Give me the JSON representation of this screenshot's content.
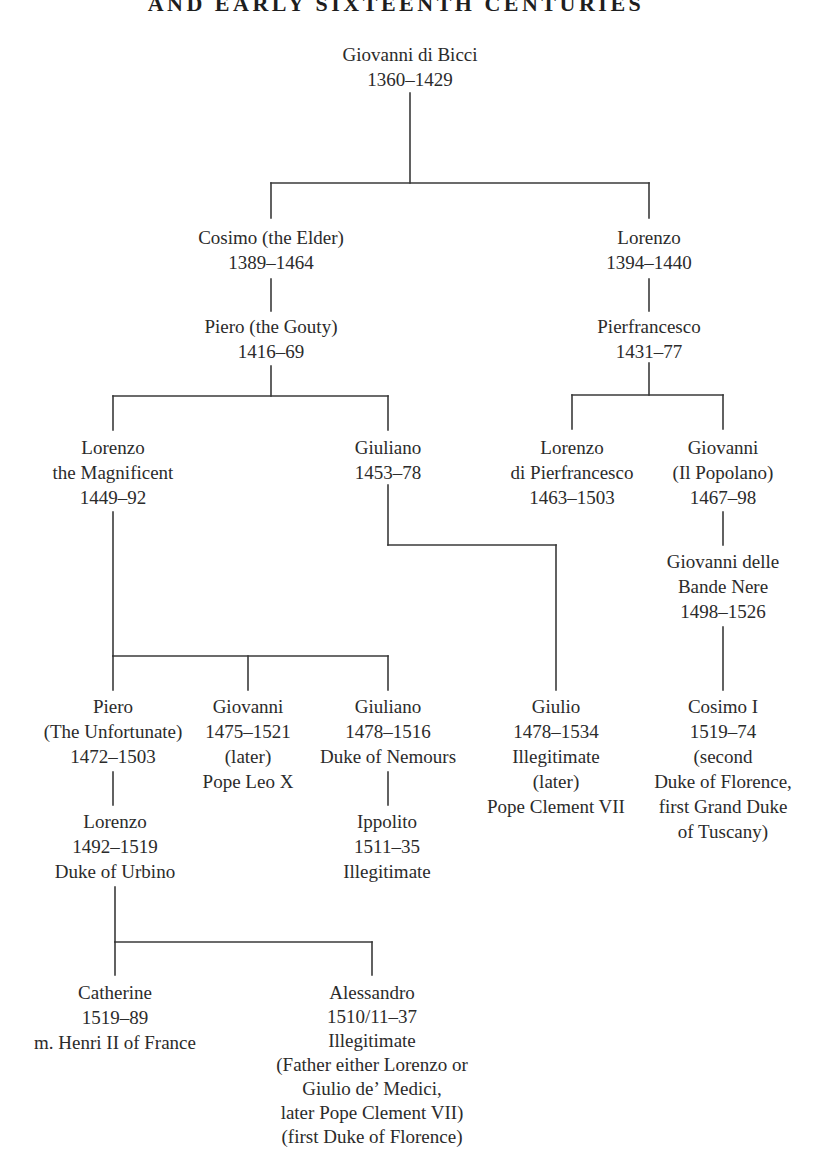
{
  "document": {
    "title_partial": "AND EARLY SIXTEENTH CENTURIES"
  },
  "tree": {
    "nodes": [
      {
        "id": "giovanni-di-bicci",
        "lines": [
          "Giovanni di Bicci",
          "1360–1429"
        ]
      },
      {
        "id": "cosimo-the-elder",
        "lines": [
          "Cosimo (the Elder)",
          "1389–1464"
        ]
      },
      {
        "id": "lorenzo-1394",
        "lines": [
          "Lorenzo",
          "1394–1440"
        ]
      },
      {
        "id": "piero-the-gouty",
        "lines": [
          "Piero (the Gouty)",
          "1416–69"
        ]
      },
      {
        "id": "pierfrancesco",
        "lines": [
          "Pierfrancesco",
          "1431–77"
        ]
      },
      {
        "id": "lorenzo-the-magnificent",
        "lines": [
          "Lorenzo",
          "the Magnificent",
          "1449–92"
        ]
      },
      {
        "id": "giuliano-1453",
        "lines": [
          "Giuliano",
          "1453–78"
        ]
      },
      {
        "id": "lorenzo-di-pierfrancesco",
        "lines": [
          "Lorenzo",
          "di Pierfrancesco",
          "1463–1503"
        ]
      },
      {
        "id": "giovanni-il-popolano",
        "lines": [
          "Giovanni",
          "(Il Popolano)",
          "1467–98"
        ]
      },
      {
        "id": "giovanni-delle-bande-nere",
        "lines": [
          "Giovanni delle",
          "Bande Nere",
          "1498–1526"
        ]
      },
      {
        "id": "piero-the-unfortunate",
        "lines": [
          "Piero",
          "(The Unfortunate)",
          "1472–1503"
        ]
      },
      {
        "id": "giovanni-pope-leo-x",
        "lines": [
          "Giovanni",
          "1475–1521",
          "(later)",
          "Pope Leo X"
        ]
      },
      {
        "id": "giuliano-duke-of-nemours",
        "lines": [
          "Giuliano",
          "1478–1516",
          "Duke of Nemours"
        ]
      },
      {
        "id": "giulio-pope-clement-vii",
        "lines": [
          "Giulio",
          "1478–1534",
          "Illegitimate",
          "(later)",
          "Pope Clement VII"
        ]
      },
      {
        "id": "cosimo-i",
        "lines": [
          "Cosimo I",
          "1519–74",
          "(second",
          "Duke of Florence,",
          "first Grand Duke",
          "of Tuscany)"
        ]
      },
      {
        "id": "lorenzo-duke-of-urbino",
        "lines": [
          "Lorenzo",
          "1492–1519",
          "Duke of Urbino"
        ]
      },
      {
        "id": "ippolito",
        "lines": [
          "Ippolito",
          "1511–35",
          "Illegitimate"
        ]
      },
      {
        "id": "catherine",
        "lines": [
          "Catherine",
          "1519–89",
          "m. Henri II of France"
        ]
      },
      {
        "id": "alessandro",
        "lines": [
          "Alessandro",
          "1510/11–37",
          "Illegitimate",
          "(Father either Lorenzo or",
          "Giulio de’ Medici,",
          "later Pope Clement VII)",
          "(first Duke of Florence)"
        ]
      }
    ],
    "relations": [
      [
        "giovanni-di-bicci",
        "cosimo-the-elder"
      ],
      [
        "giovanni-di-bicci",
        "lorenzo-1394"
      ],
      [
        "cosimo-the-elder",
        "piero-the-gouty"
      ],
      [
        "lorenzo-1394",
        "pierfrancesco"
      ],
      [
        "piero-the-gouty",
        "lorenzo-the-magnificent"
      ],
      [
        "piero-the-gouty",
        "giuliano-1453"
      ],
      [
        "pierfrancesco",
        "lorenzo-di-pierfrancesco"
      ],
      [
        "pierfrancesco",
        "giovanni-il-popolano"
      ],
      [
        "giovanni-il-popolano",
        "giovanni-delle-bande-nere"
      ],
      [
        "lorenzo-the-magnificent",
        "piero-the-unfortunate"
      ],
      [
        "lorenzo-the-magnificent",
        "giovanni-pope-leo-x"
      ],
      [
        "lorenzo-the-magnificent",
        "giuliano-duke-of-nemours"
      ],
      [
        "giuliano-1453",
        "giulio-pope-clement-vii"
      ],
      [
        "giovanni-delle-bande-nere",
        "cosimo-i"
      ],
      [
        "piero-the-unfortunate",
        "lorenzo-duke-of-urbino"
      ],
      [
        "giuliano-duke-of-nemours",
        "ippolito"
      ],
      [
        "lorenzo-duke-of-urbino",
        "catherine"
      ],
      [
        "lorenzo-duke-of-urbino",
        "alessandro"
      ]
    ]
  }
}
